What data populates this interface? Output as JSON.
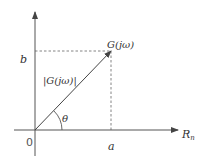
{
  "diagram": {
    "type": "complex-plane-vector",
    "colors": {
      "stroke": "#555555",
      "text": "#333333",
      "background": "#ffffff"
    },
    "labels": {
      "origin": "0",
      "imag_value": "b",
      "real_value": "a",
      "horizontal_axis": "R",
      "horizontal_axis_subscript": "n",
      "point": "G(jω)",
      "magnitude": "|G(jω)|",
      "angle": "θ"
    },
    "geometry": {
      "origin": [
        35,
        130
      ],
      "point": [
        111,
        51
      ],
      "x_axis": {
        "from": [
          14,
          130
        ],
        "to": [
          178,
          130
        ]
      },
      "y_axis": {
        "from": [
          35,
          156
        ],
        "to": [
          35,
          12
        ]
      }
    }
  }
}
